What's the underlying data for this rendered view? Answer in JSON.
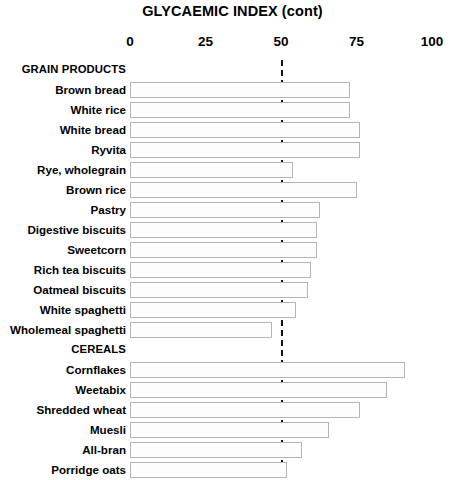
{
  "chart_data": {
    "type": "bar",
    "orientation": "horizontal",
    "title": "GLYCAEMIC INDEX (cont)",
    "xlabel": "",
    "ylabel": "",
    "xlim": [
      0,
      100
    ],
    "xticks": [
      0,
      25,
      50,
      75,
      100
    ],
    "xtick_labels": [
      "0",
      "25",
      "50",
      "75",
      "100"
    ],
    "grid": false,
    "legend": null,
    "threshold_line": {
      "value": 50,
      "style": "dashed",
      "color": "#111111"
    },
    "groups": [
      {
        "name": "GRAIN PRODUCTS",
        "categories": [
          "Brown bread",
          "White rice",
          "White bread",
          "Ryvita",
          "Rye, wholegrain",
          "Brown rice",
          "Pastry",
          "Digestive biscuits",
          "Sweetcorn",
          "Rich tea biscuits",
          "Oatmeal biscuits",
          "White spaghetti",
          "Wholemeal spaghetti"
        ],
        "values": [
          73,
          73,
          76,
          76,
          54,
          75,
          63,
          62,
          62,
          60,
          59,
          55,
          47
        ]
      },
      {
        "name": "CEREALS",
        "categories": [
          "Cornflakes",
          "Weetabix",
          "Shredded wheat",
          "Muesli",
          "All-bran",
          "Porridge oats"
        ],
        "values": [
          91,
          85,
          76,
          66,
          57,
          52
        ]
      }
    ],
    "categories": [
      "Brown bread",
      "White rice",
      "White bread",
      "Ryvita",
      "Rye, wholegrain",
      "Brown rice",
      "Pastry",
      "Digestive biscuits",
      "Sweetcorn",
      "Rich tea biscuits",
      "Oatmeal biscuits",
      "White spaghetti",
      "Wholemeal spaghetti",
      "Cornflakes",
      "Weetabix",
      "Shredded wheat",
      "Muesli",
      "All-bran",
      "Porridge oats"
    ],
    "values": [
      73,
      73,
      76,
      76,
      54,
      75,
      63,
      62,
      62,
      60,
      59,
      55,
      47,
      91,
      85,
      76,
      66,
      57,
      52
    ],
    "bar_fill": "#fdfdfd",
    "bar_border": "#b4b4b4"
  }
}
